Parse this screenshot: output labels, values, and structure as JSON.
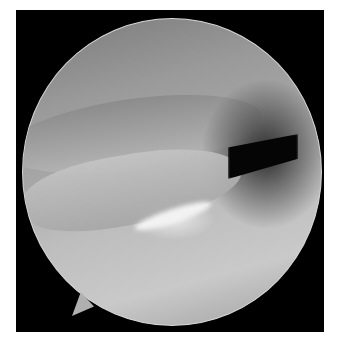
{
  "image": {
    "description": "Arthroscopic view inside a joint showing a circular endoscope field with ligament/tissue folds, a dark cavity at upper right, and an orientation notch at lower left",
    "colors": {
      "frame": "#000000",
      "tissue_light": "#c9c9c9",
      "tissue_mid": "#9a9a9a",
      "cavity": "#050505",
      "border": "#d8d8d8"
    }
  }
}
